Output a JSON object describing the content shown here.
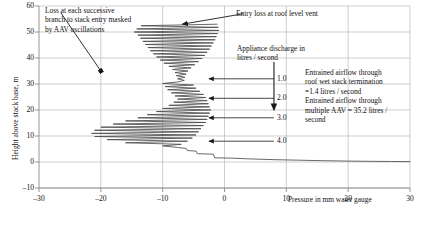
{
  "chart_data": {
    "type": "line",
    "title": "",
    "xlabel": "Pressure in mm water gauge",
    "ylabel": "Height above stack base, m",
    "xlim": [
      -30,
      30
    ],
    "ylim": [
      -10,
      60
    ],
    "xticks": [
      "-30",
      "-20",
      "-10",
      "0",
      "10",
      "20",
      "30"
    ],
    "xtick_values": [
      -30,
      -20,
      -10,
      0,
      10,
      20,
      30
    ],
    "yticks": [
      "-10",
      "0",
      "10",
      "20",
      "30",
      "40",
      "50",
      "60"
    ],
    "ytick_values": [
      -10,
      0,
      10,
      20,
      30,
      40,
      50,
      60
    ],
    "grid": true,
    "legend": "none",
    "series": [
      {
        "name": "Stack pressure profile with AAV oscillations",
        "description": "Pressure traced from stack top (53 m) down to stack base (0 m), showing damped high-frequency AAV oscillations superimposed on the mean vertical pressure gradient, then a near-horizontal tail running right to +30 mm water gauge at 0 m height.",
        "points": [
          [
            -1.2,
            53.0
          ],
          [
            -13.5,
            52.4
          ],
          [
            -1.0,
            51.8
          ],
          [
            -14.2,
            51.2
          ],
          [
            -0.9,
            50.6
          ],
          [
            -14.6,
            50.0
          ],
          [
            -1.1,
            49.4
          ],
          [
            -14.0,
            48.8
          ],
          [
            -1.3,
            48.2
          ],
          [
            -13.6,
            47.6
          ],
          [
            -1.5,
            47.0
          ],
          [
            -13.2,
            46.4
          ],
          [
            -1.8,
            45.8
          ],
          [
            -12.8,
            45.2
          ],
          [
            -2.1,
            44.6
          ],
          [
            -12.4,
            44.0
          ],
          [
            -2.4,
            43.4
          ],
          [
            -12.0,
            42.8
          ],
          [
            -2.8,
            42.2
          ],
          [
            -11.5,
            41.6
          ],
          [
            -3.2,
            41.0
          ],
          [
            -11.0,
            40.4
          ],
          [
            -3.6,
            39.8
          ],
          [
            -10.4,
            39.2
          ],
          [
            -4.2,
            38.6
          ],
          [
            -9.8,
            38.0
          ],
          [
            -4.8,
            37.4
          ],
          [
            -9.0,
            36.8
          ],
          [
            -5.4,
            36.2
          ],
          [
            -8.4,
            35.6
          ],
          [
            -5.9,
            35.0
          ],
          [
            -8.0,
            34.4
          ],
          [
            -6.2,
            33.8
          ],
          [
            -7.8,
            33.2
          ],
          [
            -6.4,
            32.6
          ],
          [
            -7.6,
            32.0
          ],
          [
            -6.5,
            31.4
          ],
          [
            -7.5,
            30.8
          ],
          [
            -10.0,
            30.2
          ],
          [
            -5.0,
            29.6
          ],
          [
            -9.6,
            29.0
          ],
          [
            -4.6,
            28.4
          ],
          [
            -9.2,
            27.8
          ],
          [
            -4.0,
            27.2
          ],
          [
            -8.6,
            26.6
          ],
          [
            -3.4,
            26.0
          ],
          [
            -8.0,
            25.4
          ],
          [
            -3.0,
            24.8
          ],
          [
            -7.6,
            24.2
          ],
          [
            -2.8,
            23.6
          ],
          [
            -8.2,
            23.0
          ],
          [
            -2.6,
            22.4
          ],
          [
            -9.0,
            21.8
          ],
          [
            -2.4,
            21.2
          ],
          [
            -10.0,
            20.6
          ],
          [
            -2.2,
            20.0
          ],
          [
            -11.0,
            19.4
          ],
          [
            -2.4,
            18.8
          ],
          [
            -12.5,
            18.2
          ],
          [
            -2.6,
            17.6
          ],
          [
            -14.0,
            17.0
          ],
          [
            -2.8,
            16.4
          ],
          [
            -16.0,
            15.8
          ],
          [
            -3.0,
            15.2
          ],
          [
            -18.0,
            14.6
          ],
          [
            -3.4,
            14.0
          ],
          [
            -20.0,
            13.4
          ],
          [
            -3.8,
            12.8
          ],
          [
            -21.0,
            12.2
          ],
          [
            -4.2,
            11.6
          ],
          [
            -21.5,
            11.0
          ],
          [
            -4.6,
            10.4
          ],
          [
            -21.0,
            9.8
          ],
          [
            -5.2,
            9.2
          ],
          [
            -19.0,
            8.6
          ],
          [
            -6.0,
            8.0
          ],
          [
            -16.0,
            7.4
          ],
          [
            -7.0,
            6.8
          ],
          [
            -10.0,
            6.2
          ],
          [
            -7.6,
            5.6
          ],
          [
            -6.2,
            5.2
          ],
          [
            -6.0,
            4.4
          ],
          [
            -4.6,
            4.2
          ],
          [
            -4.4,
            3.2
          ],
          [
            -1.8,
            3.0
          ],
          [
            -1.6,
            1.6
          ],
          [
            1.0,
            1.5
          ],
          [
            4.0,
            1.2
          ],
          [
            8.0,
            0.9
          ],
          [
            12.0,
            0.7
          ],
          [
            16.0,
            0.5
          ],
          [
            20.0,
            0.35
          ],
          [
            24.0,
            0.25
          ],
          [
            27.0,
            0.2
          ],
          [
            30.0,
            0.15
          ]
        ]
      }
    ],
    "annotations": [
      {
        "id": "loss-branch-note",
        "text": "Loss at each successive\nbranch to stack entry masked\nby AAV oscillations",
        "arrow_from": [
          -26.5,
          57.5
        ],
        "arrow_to": [
          -20.0,
          35.0
        ]
      },
      {
        "id": "entry-loss-note",
        "text": "Entry loss at roof level vent",
        "arrow_from": [
          3.0,
          57.0
        ],
        "arrow_to": [
          -6.8,
          53.0
        ]
      },
      {
        "id": "appliance-discharge-note",
        "text": "Appliance discharge in\nlitres / second",
        "arrow_from": null,
        "arrow_to": null
      },
      {
        "id": "entrained-airflow-note",
        "text": "Entrained airflow through\nroof wet stack termination\n=1.4 litres / second\nEntrained airflow through\nmultiple AAV = 35.2 litres /\nsecond",
        "arrow_from": [
          8.0,
          38.5
        ],
        "arrow_to": [
          8.0,
          20.0
        ]
      }
    ],
    "discharge_markers": [
      {
        "label": "1.0",
        "y": 32.0,
        "arrow_tip_x": -2.5,
        "label_x": 8.0
      },
      {
        "label": "2.0",
        "y": 24.5,
        "arrow_tip_x": -2.5,
        "label_x": 8.0
      },
      {
        "label": "3.0",
        "y": 17.0,
        "arrow_tip_x": -2.5,
        "label_x": 8.0
      },
      {
        "label": "4.0",
        "y": 8.0,
        "arrow_tip_x": -2.5,
        "label_x": 8.0
      }
    ]
  },
  "axis": {
    "x_caption": "Pressure in mm water gauge",
    "y_caption": "Height above stack base, m"
  },
  "colors": {
    "curve": "#4d4d4d",
    "grid": "#b9b9b9",
    "axis": "#8a8a8a",
    "text": "#111111",
    "arrow": "#1a1a1a"
  }
}
